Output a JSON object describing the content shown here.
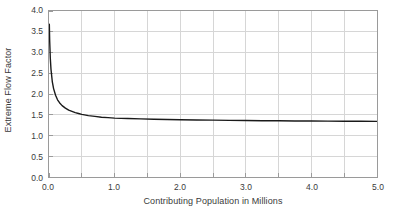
{
  "chart_data": {
    "type": "line",
    "title": "",
    "xlabel": "Contributing Population in Millions",
    "ylabel": "Extreme Flow Factor",
    "xlim": [
      0.0,
      5.0
    ],
    "ylim": [
      0.0,
      4.0
    ],
    "grid": true,
    "legend": null,
    "xticks": [
      0.0,
      0.5,
      1.0,
      1.5,
      2.0,
      2.5,
      3.0,
      3.5,
      4.0,
      4.5,
      5.0
    ],
    "yticks": [
      0.0,
      0.5,
      1.0,
      1.5,
      2.0,
      2.5,
      3.0,
      3.5,
      4.0
    ],
    "xtick_labels": [
      "0.0",
      "",
      "1.0",
      "",
      "2.0",
      "",
      "3.0",
      "",
      "4.0",
      "",
      "5.0"
    ],
    "ytick_labels": [
      "0.0",
      "0.5",
      "1.0",
      "1.5",
      "2.0",
      "2.5",
      "3.0",
      "3.5",
      "4.0"
    ],
    "series": [
      {
        "name": "Extreme Flow Factor",
        "color": "#1a1a1a",
        "x": [
          0.005,
          0.01,
          0.02,
          0.03,
          0.05,
          0.07,
          0.1,
          0.13,
          0.16,
          0.2,
          0.25,
          0.3,
          0.35,
          0.4,
          0.45,
          0.5,
          0.6,
          0.7,
          0.8,
          0.9,
          1.0,
          1.2,
          1.4,
          1.6,
          1.8,
          2.0,
          2.25,
          2.5,
          2.75,
          3.0,
          3.25,
          3.5,
          3.75,
          4.0,
          4.25,
          4.5,
          4.75,
          5.0
        ],
        "y": [
          3.68,
          3.3,
          2.86,
          2.6,
          2.3,
          2.13,
          1.97,
          1.86,
          1.79,
          1.72,
          1.66,
          1.61,
          1.58,
          1.55,
          1.53,
          1.51,
          1.48,
          1.46,
          1.44,
          1.43,
          1.42,
          1.41,
          1.4,
          1.39,
          1.385,
          1.38,
          1.375,
          1.37,
          1.365,
          1.36,
          1.357,
          1.354,
          1.351,
          1.348,
          1.346,
          1.344,
          1.342,
          1.34
        ]
      }
    ]
  },
  "axes": {
    "ylabel_text": "Extreme Flow Factor",
    "xlabel_text": "Contributing Population in Millions"
  },
  "style": {
    "grid_color": "#d6d6d6",
    "axis_color": "#9a9a9a",
    "curve_color": "#1a1a1a",
    "background": "#ffffff"
  }
}
